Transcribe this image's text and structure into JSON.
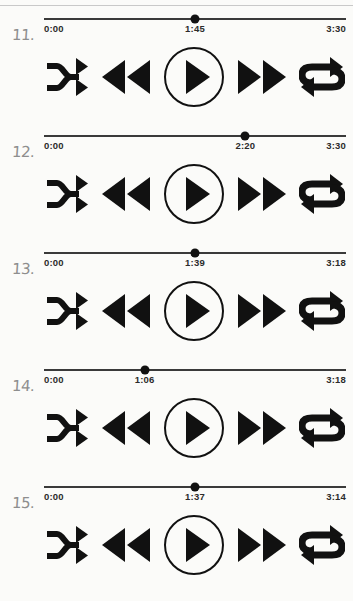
{
  "page": {
    "background_color": "#fbfbf9",
    "ink_color": "#111111",
    "index_color": "#8e8e8e"
  },
  "controls": {
    "shuffle_label": "Shuffle",
    "rewind_label": "Rewind",
    "play_label": "Play",
    "forward_label": "Fast forward",
    "repeat_label": "Repeat"
  },
  "players": [
    {
      "index": "11.",
      "elapsed": "0:00",
      "current": "1:45",
      "total": "3:30",
      "progress_percent": 50
    },
    {
      "index": "12.",
      "elapsed": "0:00",
      "current": "2:20",
      "total": "3:30",
      "progress_percent": 66.7
    },
    {
      "index": "13.",
      "elapsed": "0:00",
      "current": "1:39",
      "total": "3:18",
      "progress_percent": 50
    },
    {
      "index": "14.",
      "elapsed": "0:00",
      "current": "1:06",
      "total": "3:18",
      "progress_percent": 33.3
    },
    {
      "index": "15.",
      "elapsed": "0:00",
      "current": "1:37",
      "total": "3:14",
      "progress_percent": 50
    }
  ]
}
